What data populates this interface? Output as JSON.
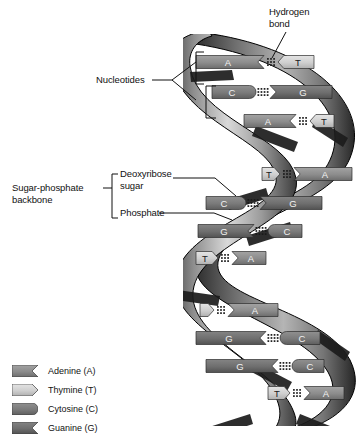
{
  "diagram": {
    "background": "#ffffff"
  },
  "annotations": {
    "hydrogen_bond": "Hydrogen\nbond",
    "nucleotides": "Nucleotides",
    "sugar_phosphate_backbone": "Sugar-phosphate\nbackbone",
    "deoxyribose_sugar": "Deoxyribose\nsugar",
    "phosphate": "Phosphate"
  },
  "legend": {
    "items": [
      {
        "label": "Adenine (A)",
        "code": "A",
        "shape": "adenine-notch",
        "color": "#8c8c8c"
      },
      {
        "label": "Thymine (T)",
        "code": "T",
        "shape": "thymine-point",
        "color": "#cfcfcf"
      },
      {
        "label": "Cytosine (C)",
        "code": "C",
        "shape": "cytosine-round",
        "color": "#7a7a7a"
      },
      {
        "label": "Guanine (G)",
        "code": "G",
        "shape": "guanine-notch",
        "color": "#6e6e6e"
      }
    ]
  },
  "colors": {
    "adenine": "#8c8c8c",
    "thymine": "#cfcfcf",
    "cytosine": "#7a7a7a",
    "guanine": "#6e6e6e",
    "backbone_light": "#d8d8d8",
    "backbone_mid": "#9a9a9a",
    "backbone_dark": "#2a2a2a",
    "phosphate_band": "#1e1e1e",
    "bond_dot": "#1a1a1a",
    "outline": "#000000",
    "label_text": "#111111"
  },
  "helix": {
    "turns": 3,
    "base_pairs": [
      {
        "index": 1,
        "left": "A",
        "right": "T",
        "bonds": 2,
        "y": 62,
        "left_w": 68,
        "right_w": 36,
        "gap_x": 268,
        "x0": 196
      },
      {
        "index": 2,
        "left": "C",
        "right": "G",
        "bonds": 3,
        "y": 92,
        "left_w": 44,
        "right_w": 62,
        "gap_x": 238,
        "x0": 212
      },
      {
        "index": 3,
        "left": "A",
        "right": "T",
        "bonds": 2,
        "y": 121,
        "left_w": 52,
        "right_w": 24,
        "gap_x": 312,
        "x0": 244
      },
      {
        "index": 4,
        "left": "T",
        "right": "A",
        "bonds": 2,
        "y": 174,
        "left_w": 18,
        "right_w": 58,
        "gap_x": 290,
        "x0": 262
      },
      {
        "index": 5,
        "left": "C",
        "right": "G",
        "bonds": 3,
        "y": 203,
        "left_w": 40,
        "right_w": 62,
        "gap_x": 240,
        "x0": 206
      },
      {
        "index": 6,
        "left": "G",
        "right": "C",
        "bonds": 3,
        "y": 231,
        "left_w": 56,
        "right_w": 34,
        "gap_x": 266,
        "x0": 198
      },
      {
        "index": 7,
        "left": "T",
        "right": "A",
        "bonds": 2,
        "y": 258,
        "left_w": 22,
        "right_w": 34,
        "gap_x": 222,
        "x0": 196
      },
      {
        "index": 8,
        "left": "T",
        "right": "A",
        "bonds": 2,
        "y": 310,
        "left_w": 14,
        "right_w": 50,
        "gap_x": 230,
        "x0": 200
      },
      {
        "index": 9,
        "left": "G",
        "right": "C",
        "bonds": 3,
        "y": 338,
        "left_w": 70,
        "right_w": 40,
        "gap_x": 272,
        "x0": 196
      },
      {
        "index": 10,
        "left": "G",
        "right": "C",
        "bonds": 3,
        "y": 366,
        "left_w": 72,
        "right_w": 32,
        "gap_x": 300,
        "x0": 206
      },
      {
        "index": 11,
        "left": "T",
        "right": "A",
        "bonds": 2,
        "y": 393,
        "left_w": 22,
        "right_w": 40,
        "gap_x": 296,
        "x0": 268
      }
    ]
  }
}
